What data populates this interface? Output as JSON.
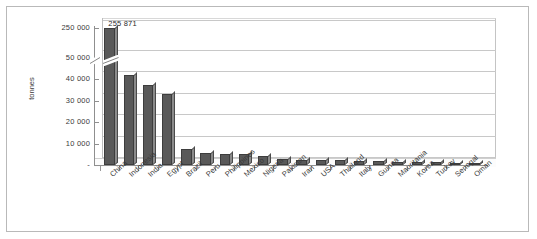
{
  "chart_data": {
    "type": "bar",
    "title": "",
    "xlabel": "",
    "ylabel": "tonnes",
    "categories": [
      "China",
      "Indonesia",
      "India",
      "Egypt",
      "Brazil",
      "Peru",
      "Philippines",
      "Mexico",
      "Nigeria",
      "Pakistan",
      "Iran",
      "USA",
      "Thailand",
      "Italy",
      "Guinea",
      "Mauritania",
      "Korea",
      "Turkey",
      "Senegal",
      "Oman"
    ],
    "values": [
      255871,
      42000,
      37500,
      33000,
      7500,
      5600,
      5300,
      5100,
      4300,
      2900,
      2500,
      2400,
      2300,
      2100,
      1700,
      1400,
      1300,
      1200,
      1000,
      900
    ],
    "data_labels": [
      {
        "category": "China",
        "text": "255 871"
      }
    ],
    "ytick_labels": [
      "250 000",
      "50 000",
      "40 000",
      "30 000",
      "20 000",
      "10 000",
      "-"
    ],
    "ytick_values": [
      250000,
      50000,
      40000,
      30000,
      20000,
      10000,
      0
    ],
    "ylim": [
      0,
      50000
    ],
    "axis_break": {
      "present": true,
      "below": 50000,
      "above": 250000
    },
    "grid": true,
    "legend": "none",
    "style": "3d-column",
    "colors": {
      "bar_front": "#595959",
      "bar_side": "#8b8b8b",
      "gridline": "#c8c8c8",
      "axis": "#8f8f8f",
      "frame": "#b9b9b9",
      "text": "#3a3a3a",
      "background": "#ffffff"
    }
  }
}
